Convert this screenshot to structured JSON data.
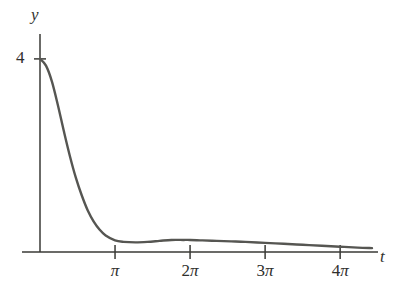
{
  "figure": {
    "background_color": "#ffffff",
    "curve_color": "#565652",
    "axis_color": "#3a3a36",
    "axis_labels": {
      "y": "y",
      "t": "t"
    },
    "y_ticks": [
      {
        "label": "4",
        "value": 4
      }
    ],
    "x_ticks": [
      {
        "label": "π",
        "number": "",
        "pi": "π",
        "value": 3.14159
      },
      {
        "label": "2π",
        "number": "2",
        "pi": "π",
        "value": 6.28319
      },
      {
        "label": "3π",
        "number": "3",
        "pi": "π",
        "value": 9.42478
      },
      {
        "label": "4π",
        "number": "4",
        "pi": "π",
        "value": 12.56637
      }
    ]
  },
  "chart_data": {
    "type": "line",
    "title": "",
    "subtitle": "",
    "xlabel": "t",
    "ylabel": "y",
    "xlim": [
      0,
      13.9
    ],
    "ylim": [
      0,
      4.35
    ],
    "grid": false,
    "legend": null,
    "annotations": [],
    "x_tick_values": [
      3.14159,
      6.28319,
      9.42478,
      12.56637
    ],
    "x_tick_labels": [
      "π",
      "2π",
      "3π",
      "4π"
    ],
    "y_tick_values": [
      4
    ],
    "y_tick_labels": [
      "4"
    ],
    "series": [
      {
        "name": "y(t)",
        "color": "#565652",
        "x": [
          0,
          0.25,
          0.5,
          0.75,
          1,
          1.25,
          1.5,
          1.75,
          2,
          2.25,
          2.5,
          2.75,
          3.14159,
          3.5,
          4,
          4.5,
          5,
          5.5,
          6,
          6.28319,
          6.8,
          7.4,
          8,
          8.6,
          9.42478,
          10.2,
          11,
          11.8,
          12.56637,
          13.3,
          13.9
        ],
        "y": [
          4.0,
          3.86,
          3.53,
          3.04,
          2.5,
          1.99,
          1.54,
          1.17,
          0.86,
          0.63,
          0.46,
          0.34,
          0.24,
          0.21,
          0.2,
          0.21,
          0.23,
          0.25,
          0.25,
          0.25,
          0.24,
          0.23,
          0.22,
          0.21,
          0.19,
          0.17,
          0.15,
          0.13,
          0.11,
          0.09,
          0.08
        ]
      }
    ]
  }
}
